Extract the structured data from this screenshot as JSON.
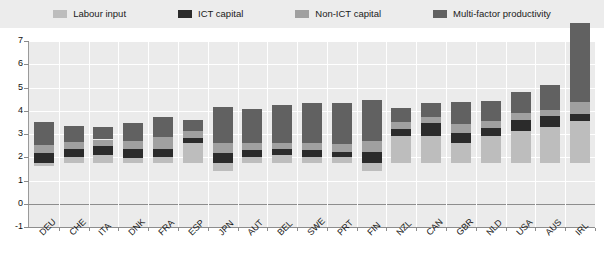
{
  "legend": {
    "items": [
      {
        "label": "Labour input",
        "color": "#bdbdbd",
        "icon": "legend-swatch-labour-input"
      },
      {
        "label": "ICT capital",
        "color": "#2b2b2b",
        "icon": "legend-swatch-ict-capital"
      },
      {
        "label": "Non-ICT capital",
        "color": "#a0a0a0",
        "icon": "legend-swatch-non-ict-capital"
      },
      {
        "label": "Multi-factor productivity",
        "color": "#616161",
        "icon": "legend-swatch-mfp"
      }
    ]
  },
  "axis": {
    "y_ticks": [
      "7",
      "6",
      "5",
      "4",
      "3",
      "2",
      "1",
      "0",
      "-1"
    ]
  },
  "chart_data": {
    "type": "bar",
    "title": "",
    "subtitle": "",
    "xlabel": "",
    "ylabel": "",
    "ylim": [
      -1,
      7
    ],
    "grid": true,
    "stacked": true,
    "legend_position": "top",
    "categories": [
      "DEU",
      "CHE",
      "ITA",
      "DNK",
      "FRA",
      "ESP",
      "JPN",
      "AUT",
      "BEL",
      "SWE",
      "PRT",
      "FIN",
      "NZL",
      "CAN",
      "GBR",
      "NLD",
      "USA",
      "AUS",
      "IRL"
    ],
    "series": [
      {
        "name": "Labour input",
        "color": "#bdbdbd",
        "values": [
          -0.15,
          0.25,
          0.35,
          0.2,
          0.25,
          0.85,
          -0.35,
          0.25,
          0.35,
          0.25,
          0.25,
          -0.35,
          1.15,
          1.15,
          0.85,
          1.15,
          1.35,
          1.55,
          1.8
        ]
      },
      {
        "name": "ICT capital",
        "color": "#2b2b2b",
        "values": [
          0.4,
          0.35,
          0.35,
          0.4,
          0.35,
          0.2,
          0.4,
          0.3,
          0.25,
          0.3,
          0.2,
          0.45,
          0.3,
          0.55,
          0.45,
          0.35,
          0.5,
          0.45,
          0.3
        ]
      },
      {
        "name": "Non-ICT capital",
        "color": "#a0a0a0",
        "values": [
          0.35,
          0.3,
          0.3,
          0.35,
          0.5,
          0.3,
          0.45,
          0.3,
          0.25,
          0.3,
          0.35,
          0.5,
          0.3,
          0.25,
          0.35,
          0.3,
          0.3,
          0.25,
          0.5
        ]
      },
      {
        "name": "Multi-factor productivity",
        "color": "#616161",
        "values": [
          1.0,
          0.7,
          0.55,
          0.75,
          0.85,
          0.5,
          1.55,
          1.45,
          1.65,
          1.7,
          1.75,
          1.75,
          0.6,
          0.6,
          0.95,
          0.85,
          0.9,
          1.1,
          3.4
        ]
      }
    ],
    "totals_positive": [
      1.75,
      1.6,
      1.55,
      1.7,
      1.95,
      1.85,
      2.4,
      2.3,
      2.5,
      2.55,
      2.55,
      2.7,
      2.35,
      2.55,
      2.6,
      2.65,
      3.05,
      3.35,
      6.0
    ]
  }
}
